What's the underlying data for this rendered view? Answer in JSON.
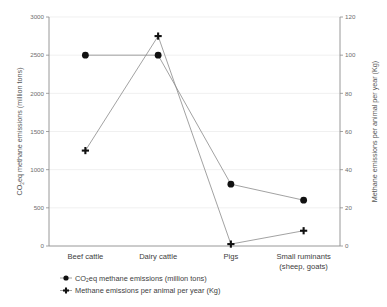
{
  "chart_data": {
    "type": "line",
    "title": "",
    "categories": [
      "Beef cattle",
      "Dairy cattle",
      "Pigs",
      "Small ruminants (sheep, goats)"
    ],
    "category_labels": [
      {
        "line1": "Beef cattle",
        "line2": ""
      },
      {
        "line1": "Dairy cattle",
        "line2": ""
      },
      {
        "line1": "Pigs",
        "line2": ""
      },
      {
        "line1": "Small ruminants",
        "line2": "(sheep, goats)"
      }
    ],
    "series": [
      {
        "name": "CO2eq methane emissions (million tons)",
        "marker": "circle",
        "axis": "left",
        "values": [
          2500,
          2500,
          810,
          600
        ]
      },
      {
        "name": "Methane emissions per animal per year (Kg)",
        "marker": "plus",
        "axis": "right",
        "values": [
          50,
          110,
          1,
          8
        ]
      }
    ],
    "xlabel": "",
    "ylabel": "CO2eq methane emissions (million tons)",
    "ylabel_prefix": "CO",
    "ylabel_sub": "2",
    "ylabel_suffix": "eq methane emissions (million tons)",
    "y2label": "Methane emissions per animal per year (Kg)",
    "ylim": [
      0,
      3000
    ],
    "yticks": [
      0,
      500,
      1000,
      1500,
      2000,
      2500,
      3000
    ],
    "y2lim": [
      0,
      120
    ],
    "y2ticks": [
      0,
      20,
      40,
      60,
      80,
      100,
      120
    ],
    "grid": true,
    "grid_axis": "y",
    "legend_position": "bottom-left",
    "colors": {
      "marker": "#111111",
      "line": "#8a8a8a",
      "grid": "#e9e9e9",
      "axis": "#8d8d8d",
      "text": "#3d3d3d",
      "background": "#ffffff"
    }
  },
  "legend": {
    "items": [
      {
        "label_prefix": "CO",
        "label_sub": "2",
        "label_suffix": "eq methane emissions (million tons)",
        "marker": "circle"
      },
      {
        "label_prefix": "",
        "label_sub": "",
        "label_suffix": "Methane emissions per animal per year (Kg)",
        "marker": "plus"
      }
    ]
  }
}
